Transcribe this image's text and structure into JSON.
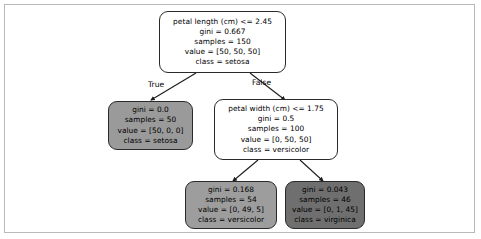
{
  "diagram": {
    "type": "decision-tree",
    "title": "",
    "frame": {
      "border_color": "#b9b9b9",
      "background": "#ffffff"
    },
    "edge_labels": {
      "true_label": "True",
      "false_label": "False"
    },
    "nodes": [
      {
        "id": "root",
        "kind": "internal",
        "fill": "#ffffff",
        "lines": [
          "petal length (cm) <= 2.45",
          "gini = 0.667",
          "samples = 150",
          "value = [50, 50, 50]",
          "class = setosa"
        ],
        "feature": "petal length (cm)",
        "threshold": 2.45,
        "gini": 0.667,
        "samples": 150,
        "value": [
          50,
          50,
          50
        ],
        "class": "setosa"
      },
      {
        "id": "leaf-setosa",
        "kind": "leaf",
        "fill": "#9a9a9a",
        "lines": [
          "gini = 0.0",
          "samples = 50",
          "value = [50, 0, 0]",
          "class = setosa"
        ],
        "gini": 0.0,
        "samples": 50,
        "value": [
          50,
          0,
          0
        ],
        "class": "setosa"
      },
      {
        "id": "split-petal-width",
        "kind": "internal",
        "fill": "#ffffff",
        "lines": [
          "petal width (cm) <= 1.75",
          "gini = 0.5",
          "samples = 100",
          "value = [0, 50, 50]",
          "class = versicolor"
        ],
        "feature": "petal width (cm)",
        "threshold": 1.75,
        "gini": 0.5,
        "samples": 100,
        "value": [
          0,
          50,
          50
        ],
        "class": "versicolor"
      },
      {
        "id": "leaf-versicolor",
        "kind": "leaf",
        "fill": "#9d9d9d",
        "lines": [
          "gini = 0.168",
          "samples = 54",
          "value = [0, 49, 5]",
          "class = versicolor"
        ],
        "gini": 0.168,
        "samples": 54,
        "value": [
          0,
          49,
          5
        ],
        "class": "versicolor"
      },
      {
        "id": "leaf-virginica",
        "kind": "leaf",
        "fill": "#6f6f6f",
        "lines": [
          "gini = 0.043",
          "samples = 46",
          "value = [0, 1, 45]",
          "class = virginica"
        ],
        "gini": 0.043,
        "samples": 46,
        "value": [
          0,
          1,
          45
        ],
        "class": "virginica"
      }
    ]
  }
}
